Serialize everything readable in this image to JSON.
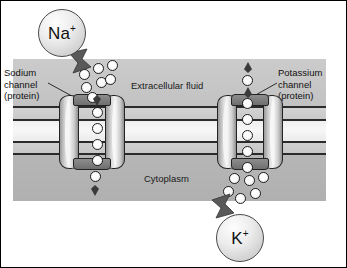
{
  "figure": {
    "frame_color": "#000000",
    "background": "#ffffff"
  },
  "regions": [
    {
      "key": "extracellular",
      "label": "Extracellular fluid",
      "color": "#c6c6c6"
    },
    {
      "key": "membrane",
      "label": "",
      "color": "#f2f2f2"
    },
    {
      "key": "cytoplasm",
      "label": "Cytoplasm",
      "color": "#b3b3b3"
    }
  ],
  "labels": {
    "extracellular": "Extracellular fluid",
    "cytoplasm": "Cytoplasm",
    "sodium_channel": {
      "line1": "Sodium",
      "line2": "channel",
      "line3": "(protein)"
    },
    "potassium_channel": {
      "line1": "Potassium",
      "line2": "channel",
      "line3": "(protein)"
    }
  },
  "ion_bubbles": [
    {
      "key": "sodium",
      "symbol": "Na",
      "charge": "+",
      "position": "top-left",
      "flow": "inward"
    },
    {
      "key": "potassium",
      "symbol": "K",
      "charge": "+",
      "position": "bottom-right",
      "flow": "outward"
    }
  ],
  "channels": [
    {
      "key": "sodium-channel",
      "label": "Sodium channel (protein)",
      "direction": "into-cell"
    },
    {
      "key": "potassium-channel",
      "label": "Potassium channel (protein)",
      "direction": "out-of-cell"
    }
  ],
  "colors": {
    "ion_fill": "#ffffff",
    "ion_stroke": "#1f1f1f",
    "protein_fill": "#e0e0e0",
    "arrow": "#4a4a4a",
    "membrane_line": "#2b2b2b"
  }
}
